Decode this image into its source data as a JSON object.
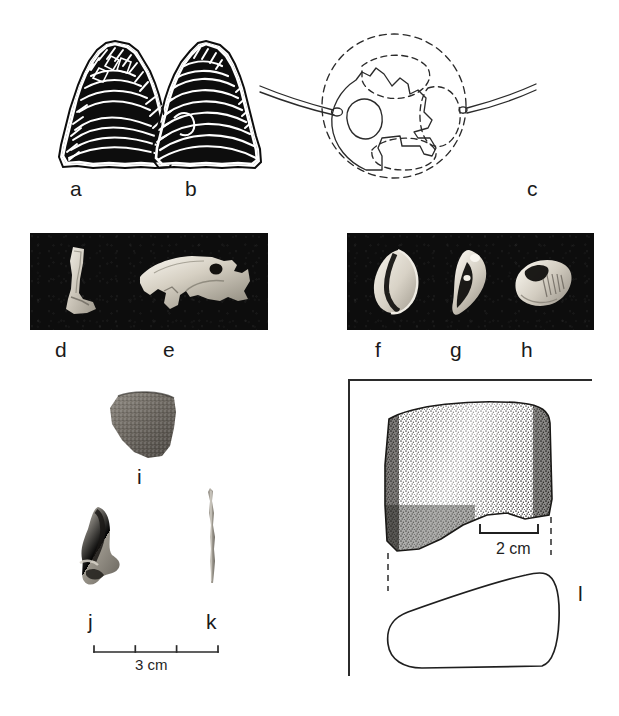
{
  "figure": {
    "kind": "archaeological-artifact-plate",
    "background_color": "#ffffff",
    "ink_color": "#1a1a1a",
    "photo_background_color": "#0d0d0d",
    "width": 619,
    "height": 716
  },
  "labels": {
    "a": "a",
    "b": "b",
    "c": "c",
    "d": "d",
    "e": "e",
    "f": "f",
    "g": "g",
    "h": "h",
    "i": "i",
    "j": "j",
    "k": "k",
    "l": "l"
  },
  "items": [
    {
      "id": "a",
      "label": "a",
      "medium": "line-drawing",
      "subject": "chipped stone projectile point, obverse"
    },
    {
      "id": "b",
      "label": "b",
      "medium": "line-drawing",
      "subject": "chipped stone projectile point, reverse"
    },
    {
      "id": "c",
      "label": "c",
      "medium": "line-drawing",
      "subject": "perforated disc pendant with reconstructed outline and suspension cord"
    },
    {
      "id": "d",
      "label": "d",
      "medium": "photograph",
      "subject": "worked bone fragment"
    },
    {
      "id": "e",
      "label": "e",
      "medium": "photograph",
      "subject": "carved shell zoomorphic ornament with drilled perforation"
    },
    {
      "id": "f",
      "label": "f",
      "medium": "photograph",
      "subject": "marine shell bead"
    },
    {
      "id": "g",
      "label": "g",
      "medium": "photograph",
      "subject": "marine shell bead"
    },
    {
      "id": "h",
      "label": "h",
      "medium": "photograph",
      "subject": "marine shell bead, incised"
    },
    {
      "id": "i",
      "label": "i",
      "medium": "photograph",
      "subject": "ceramic sherd"
    },
    {
      "id": "j",
      "label": "j",
      "medium": "photograph",
      "subject": "bone / tooth fragment"
    },
    {
      "id": "k",
      "label": "k",
      "medium": "photograph",
      "subject": "bone needle or awl"
    },
    {
      "id": "l",
      "label": "l",
      "medium": "line-drawing",
      "subject": "ground stone celt with stippled shading and cross-section profile"
    }
  ],
  "scales": [
    {
      "id": "scale-3cm",
      "text": "3 cm",
      "value": 3,
      "unit": "cm",
      "ticks": 4,
      "applies_to": [
        "i",
        "j",
        "k"
      ]
    },
    {
      "id": "scale-2cm",
      "text": "2 cm",
      "value": 2,
      "unit": "cm",
      "ticks": 2,
      "applies_to": [
        "l"
      ]
    }
  ],
  "panels": [
    {
      "id": "photo-panel-de",
      "items": [
        "d",
        "e"
      ]
    },
    {
      "id": "photo-panel-fgh",
      "items": [
        "f",
        "g",
        "h"
      ]
    },
    {
      "id": "frame-panel-l",
      "items": [
        "l"
      ]
    }
  ]
}
